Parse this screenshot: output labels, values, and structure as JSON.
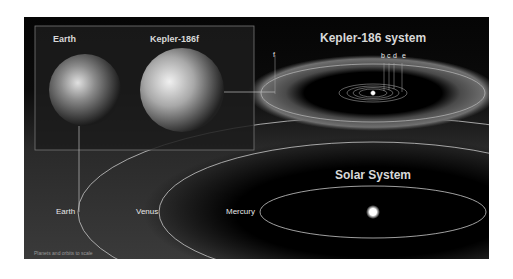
{
  "inset": {
    "planets": [
      {
        "label": "Earth"
      },
      {
        "label": "Kepler-186f"
      }
    ]
  },
  "kepler_system": {
    "title": "Kepler-186 system",
    "planet_labels": [
      "b",
      "c",
      "d",
      "e",
      "f"
    ]
  },
  "solar_system": {
    "title": "Solar System",
    "planet_labels": [
      "Mercury",
      "Venus",
      "Earth"
    ]
  },
  "footnote": "Planets and orbits to scale",
  "colors": {
    "background": "#0a0a0a",
    "habitable_zone": "#6a6a6a",
    "orbit_line": "#d0d0d0",
    "text": "#e8e8e8"
  }
}
